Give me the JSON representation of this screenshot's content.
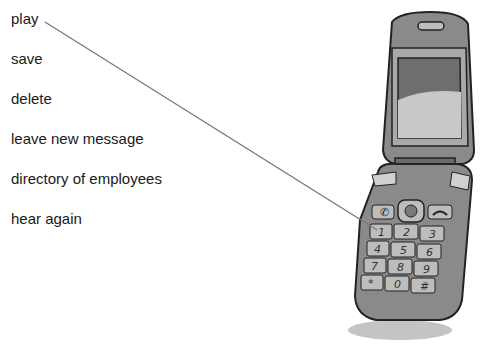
{
  "exercise": {
    "options": [
      {
        "label": "play"
      },
      {
        "label": "save"
      },
      {
        "label": "delete"
      },
      {
        "label": "leave new message"
      },
      {
        "label": "directory of employees"
      },
      {
        "label": "hear again"
      }
    ],
    "connector": {
      "from_option": "play",
      "to_key": "1",
      "color": "#777777"
    }
  },
  "phone": {
    "keys": [
      "1",
      "2",
      "3",
      "4",
      "5",
      "6",
      "7",
      "8",
      "9",
      "*",
      "0",
      "#"
    ],
    "function_keys": [
      "call-icon",
      "nav-button",
      "end-call-icon"
    ],
    "colors": {
      "body": "#8a8a8a",
      "body_dark": "#5c5c5c",
      "screen": "#6e6e6e",
      "screen_glare": "#c8c8c8",
      "keys": "#bdbdbd",
      "shadow": "#c4c4c4"
    }
  }
}
